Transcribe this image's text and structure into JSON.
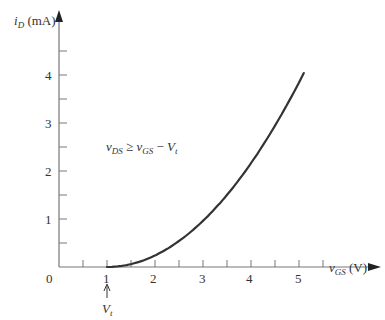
{
  "chart_data": {
    "type": "line",
    "title": "",
    "xlabel": "vGS (V)",
    "ylabel": "iD (mA)",
    "xlim": [
      0,
      5.6
    ],
    "ylim": [
      0,
      4.8
    ],
    "x_ticks": [
      0,
      1,
      2,
      3,
      4,
      5
    ],
    "x_minor_ticks": [
      0.5,
      1.5,
      2.5,
      3.5,
      4.5,
      5.5
    ],
    "y_ticks": [
      1,
      2,
      3,
      4
    ],
    "y_minor_ticks": [
      0.5,
      1.5,
      2.5,
      3.5,
      4.5
    ],
    "grid": false,
    "legend": null,
    "annotations": [
      {
        "text": "vDS ≥ vGS − Vt",
        "position": [
          1.0,
          2.6
        ]
      },
      {
        "text": "Vt",
        "points_to": [
          1,
          0
        ],
        "arrow": true
      }
    ],
    "series": [
      {
        "name": "iD vs vGS (saturation)",
        "x": [
          1.0,
          1.5,
          2.0,
          2.5,
          3.0,
          3.5,
          4.0,
          4.5,
          5.0,
          5.1
        ],
        "y": [
          0.0,
          0.06,
          0.24,
          0.54,
          0.96,
          1.5,
          2.16,
          2.94,
          3.84,
          4.04
        ]
      }
    ]
  },
  "labels": {
    "y_axis_var": "i",
    "y_axis_sub": "D",
    "y_axis_unit": "(mA)",
    "x_axis_var": "v",
    "x_axis_sub": "GS",
    "x_axis_unit": "(V)",
    "origin": "0",
    "x_tick_labels": [
      "1",
      "2",
      "3",
      "4",
      "5"
    ],
    "y_tick_labels": [
      "1",
      "2",
      "3",
      "4"
    ],
    "vt_var": "V",
    "vt_sub": "t",
    "condition": {
      "a": "v",
      "a_sub": "DS",
      "op": " ≥ ",
      "b": "v",
      "b_sub": "GS",
      "minus": " − ",
      "c": "V",
      "c_sub": "t"
    }
  }
}
